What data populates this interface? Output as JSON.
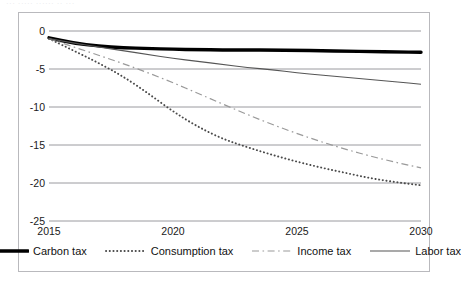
{
  "caption": {
    "text": "···  ·····  ······ ·· ···"
  },
  "chart_data": {
    "type": "line",
    "title": "",
    "subtitle": "",
    "xlabel": "",
    "ylabel": "",
    "xlim": [
      2015,
      2030
    ],
    "ylim": [
      -25,
      0
    ],
    "yticks": [
      0,
      -5,
      -10,
      -15,
      -20,
      -25
    ],
    "ytick_labels": [
      "0",
      "-5",
      "-10",
      "-15",
      "-20",
      "-25"
    ],
    "xticks": [
      2015,
      2020,
      2025,
      2030
    ],
    "xtick_labels": [
      "2015",
      "2020",
      "2025",
      "2030"
    ],
    "grid": "horizontal",
    "legend_position": "bottom",
    "x": [
      2015,
      2016,
      2017,
      2018,
      2019,
      2020,
      2021,
      2022,
      2023,
      2024,
      2025,
      2026,
      2027,
      2028,
      2029,
      2030
    ],
    "series": [
      {
        "name": "Carbon tax",
        "style": "solid-thick",
        "color": "#000000",
        "values": [
          -0.9,
          -1.6,
          -2.0,
          -2.2,
          -2.3,
          -2.4,
          -2.45,
          -2.5,
          -2.5,
          -2.5,
          -2.55,
          -2.6,
          -2.65,
          -2.7,
          -2.75,
          -2.8
        ]
      },
      {
        "name": "Consumption tax",
        "style": "dotted",
        "color": "#4a4a4a",
        "values": [
          -1.0,
          -2.6,
          -4.2,
          -6.0,
          -8.2,
          -10.6,
          -12.6,
          -14.2,
          -15.3,
          -16.3,
          -17.2,
          -18.0,
          -18.7,
          -19.4,
          -19.9,
          -20.3
        ]
      },
      {
        "name": "Income tax",
        "style": "dash-dot",
        "color": "#9a9a9a",
        "values": [
          -1.0,
          -2.1,
          -3.2,
          -4.3,
          -5.5,
          -6.8,
          -8.2,
          -9.6,
          -11.0,
          -12.3,
          -13.5,
          -14.6,
          -15.6,
          -16.5,
          -17.3,
          -18.0
        ]
      },
      {
        "name": "Labor tax",
        "style": "solid-thin",
        "color": "#555555",
        "values": [
          -1.0,
          -1.6,
          -2.1,
          -2.6,
          -3.1,
          -3.6,
          -4.0,
          -4.4,
          -4.8,
          -5.1,
          -5.5,
          -5.8,
          -6.1,
          -6.4,
          -6.7,
          -7.0
        ]
      }
    ]
  }
}
